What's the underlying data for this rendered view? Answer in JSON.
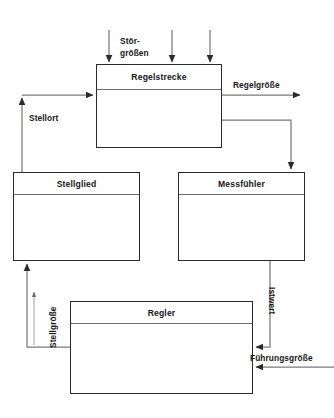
{
  "diagram": {
    "type": "control-loop-block-diagram",
    "language": "de",
    "colors": {
      "block_border": "#2b2b2b",
      "header_divider": "#6e6e6e",
      "connector": "#6e6e6e",
      "connector_dark": "#4a4a4a",
      "text": "#161616",
      "background": "#ffffff"
    },
    "blocks": [
      {
        "id": "regelstrecke",
        "label": "Regelstrecke",
        "x": 96,
        "y": 64,
        "w": 126,
        "h": 84,
        "header_h": 25
      },
      {
        "id": "stellglied",
        "label": "Stellglied",
        "x": 13,
        "y": 172,
        "w": 127,
        "h": 89,
        "header_h": 22
      },
      {
        "id": "messfuehler",
        "label": "Messfühler",
        "x": 178,
        "y": 172,
        "w": 127,
        "h": 89,
        "header_h": 22
      },
      {
        "id": "regler",
        "label": "Regler",
        "x": 70,
        "y": 301,
        "w": 183,
        "h": 93,
        "header_h": 22
      }
    ],
    "edge_labels": [
      {
        "id": "stoergroessen",
        "text": "Stör-\ngrößen",
        "x": 120,
        "y": 36,
        "orientation": "horizontal-two-line"
      },
      {
        "id": "regelgroesse",
        "text": "Regelgröße",
        "x": 233,
        "y": 80,
        "orientation": "horizontal"
      },
      {
        "id": "stellort",
        "text": "Stellort",
        "x": 29,
        "y": 113,
        "orientation": "horizontal"
      },
      {
        "id": "stellgroesse",
        "text": "Stellgröße",
        "x": 48,
        "y": 348,
        "orientation": "vertical-up"
      },
      {
        "id": "istwert",
        "text": "Istwert",
        "x": 277,
        "y": 287,
        "orientation": "vertical-down"
      },
      {
        "id": "fuehrungsgroesse",
        "text": "Führungsgröße",
        "x": 250,
        "y": 353,
        "orientation": "horizontal"
      }
    ],
    "connectors": [
      {
        "id": "disturbance-arrow-1",
        "from": [
          109,
          30
        ],
        "to": [
          109,
          63
        ],
        "arrow": "end"
      },
      {
        "id": "disturbance-arrow-2",
        "from": [
          172,
          30
        ],
        "to": [
          172,
          63
        ],
        "arrow": "end"
      },
      {
        "id": "disturbance-arrow-3",
        "from": [
          210,
          30
        ],
        "to": [
          210,
          63
        ],
        "arrow": "end"
      },
      {
        "id": "stellort-to-regelstrecke",
        "path": "M 22,95 L 95,95",
        "arrow": "end"
      },
      {
        "id": "stellglied-to-stellort",
        "path": "M 22,172 L 22,96",
        "arrow": "end"
      },
      {
        "id": "regelstrecke-output",
        "path": "M 222,95 L 302,95",
        "arrow": "end"
      },
      {
        "id": "regelgroesse-branch-to-messfuehler",
        "path": "M 222,120 L 291,120 L 291,171",
        "arrow": "end"
      },
      {
        "id": "messfuehler-to-regler-istwert",
        "path": "M 270,261 L 270,347 L 254,347",
        "arrow": "end"
      },
      {
        "id": "fuehrungsgroesse-input",
        "path": "M 334,367 L 254,367",
        "arrow": "end"
      },
      {
        "id": "regler-to-stellglied",
        "path": "M 70,347 L 27,347 L 27,262",
        "arrow": "end"
      },
      {
        "id": "stellgroesse-direction-arrow",
        "path": "M 34,345 L 34,289",
        "arrow": "end"
      }
    ]
  }
}
